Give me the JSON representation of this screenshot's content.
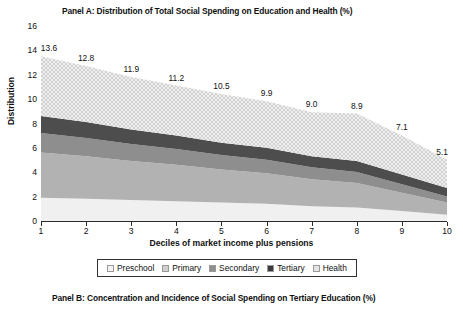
{
  "panels": {
    "a_title": "Panel A: Distribution of Total Social Spending on Education and Health (%)",
    "b_title": "Panel B: Concentration and Incidence of Social Spending on Tertiary Education (%)"
  },
  "chart_data": {
    "type": "area",
    "title": "Panel A: Distribution of Total Social Spending on Education and Health (%)",
    "xlabel": "Deciles of market income plus pensions",
    "ylabel": "Distribution",
    "stacked": true,
    "grid": false,
    "legend_position": "bottom",
    "x": [
      1,
      2,
      3,
      4,
      5,
      6,
      7,
      8,
      9,
      10
    ],
    "categories": [
      "1",
      "2",
      "3",
      "4",
      "5",
      "6",
      "7",
      "8",
      "9",
      "10"
    ],
    "xlim": [
      1,
      10
    ],
    "ylim": [
      0,
      16
    ],
    "yticks": [
      0,
      2,
      4,
      6,
      8,
      10,
      12,
      14,
      16
    ],
    "xticks": [
      1,
      2,
      3,
      4,
      5,
      6,
      7,
      8,
      9,
      10
    ],
    "totals": [
      13.6,
      12.8,
      11.9,
      11.2,
      10.5,
      9.9,
      9.0,
      8.9,
      7.1,
      5.1
    ],
    "total_labels": [
      "13.6",
      "12.8",
      "11.9",
      "11.2",
      "10.5",
      "9.9",
      "9.0",
      "8.9",
      "7.1",
      "5.1"
    ],
    "series": [
      {
        "name": "Health",
        "color": "#ececec",
        "values": [
          2.0,
          1.9,
          1.8,
          1.7,
          1.6,
          1.5,
          1.3,
          1.2,
          0.9,
          0.6
        ]
      },
      {
        "name": "Tertiary",
        "color": "#9b9b9b",
        "values": [
          3.7,
          3.5,
          3.2,
          3.0,
          2.7,
          2.5,
          2.2,
          2.0,
          1.5,
          1.0
        ]
      },
      {
        "name": "Secondary",
        "color": "#7d7d7d",
        "values": [
          1.6,
          1.5,
          1.4,
          1.3,
          1.2,
          1.1,
          1.0,
          0.9,
          0.7,
          0.5
        ]
      },
      {
        "name": "Primary",
        "color": "#4a4a4a",
        "values": [
          1.4,
          1.3,
          1.2,
          1.1,
          1.0,
          1.0,
          0.9,
          0.9,
          0.8,
          0.7
        ]
      },
      {
        "name": "Preschool",
        "color": "#dcdcdc",
        "values": [
          4.9,
          4.6,
          4.3,
          4.1,
          4.0,
          3.8,
          3.6,
          3.9,
          3.2,
          2.3
        ]
      }
    ]
  },
  "legend": {
    "items": [
      {
        "label": "Preschool",
        "color": "#f2f2f2"
      },
      {
        "label": "Primary",
        "color": "#cfcfcf"
      },
      {
        "label": "Secondary",
        "color": "#8f8f8f"
      },
      {
        "label": "Tertiary",
        "color": "#3a3a3a"
      },
      {
        "label": "Health",
        "color": "#e4e4e4"
      }
    ]
  }
}
